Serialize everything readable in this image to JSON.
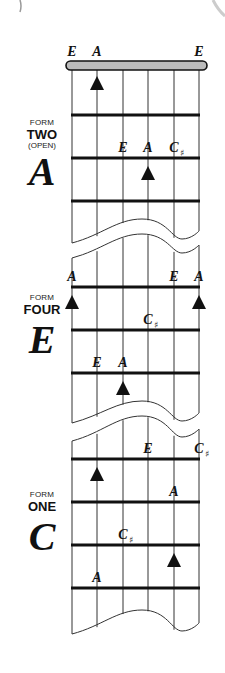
{
  "diagram": {
    "type": "guitar-fretboard-forms",
    "strings": 6,
    "colors": {
      "ink": "#111111",
      "nut_fill": "#bbbbbb",
      "background": "#ffffff"
    },
    "open_string_labels": [
      {
        "string": 1,
        "note": "E"
      },
      {
        "string": 2,
        "note": "A"
      },
      {
        "string": 6,
        "note": "E"
      }
    ],
    "sections": [
      {
        "id": "form-two",
        "form_word": "FORM",
        "form_number": "TWO",
        "form_note": "(OPEN)",
        "key": "A",
        "root_markers": [
          {
            "string": 2,
            "fret_row": 0
          },
          {
            "string": 4,
            "fret_row": 2
          }
        ],
        "notes": [
          {
            "string": 3,
            "fret_row": 2,
            "note": "E",
            "accidental": ""
          },
          {
            "string": 4,
            "fret_row": 2,
            "note": "A",
            "accidental": ""
          },
          {
            "string": 5,
            "fret_row": 2,
            "note": "C",
            "accidental": "♯"
          }
        ]
      },
      {
        "id": "form-four",
        "form_word": "FORM",
        "form_number": "FOUR",
        "form_note": "",
        "key": "E",
        "root_markers": [
          {
            "string": 1,
            "fret_row": 1
          },
          {
            "string": 6,
            "fret_row": 1
          },
          {
            "string": 3,
            "fret_row": 3
          }
        ],
        "notes": [
          {
            "string": 1,
            "fret_row": 1,
            "note": "A",
            "accidental": ""
          },
          {
            "string": 5,
            "fret_row": 1,
            "note": "E",
            "accidental": ""
          },
          {
            "string": 6,
            "fret_row": 1,
            "note": "A",
            "accidental": ""
          },
          {
            "string": 4,
            "fret_row": 2,
            "note": "C",
            "accidental": "♯"
          },
          {
            "string": 2,
            "fret_row": 3,
            "note": "E",
            "accidental": ""
          },
          {
            "string": 3,
            "fret_row": 3,
            "note": "A",
            "accidental": ""
          }
        ]
      },
      {
        "id": "form-one",
        "form_word": "FORM",
        "form_number": "ONE",
        "form_note": "",
        "key": "C",
        "root_markers": [
          {
            "string": 5,
            "fret_row": 3
          },
          {
            "string": 2,
            "fret_row": 5
          }
        ],
        "notes": [
          {
            "string": 4,
            "fret_row": 1,
            "note": "E",
            "accidental": ""
          },
          {
            "string": 6,
            "fret_row": 1,
            "note": "C",
            "accidental": "♯"
          },
          {
            "string": 5,
            "fret_row": 2,
            "note": "A",
            "accidental": ""
          },
          {
            "string": 3,
            "fret_row": 3,
            "note": "C",
            "accidental": "♯"
          },
          {
            "string": 2,
            "fret_row": 4,
            "note": "A",
            "accidental": ""
          }
        ]
      }
    ]
  }
}
